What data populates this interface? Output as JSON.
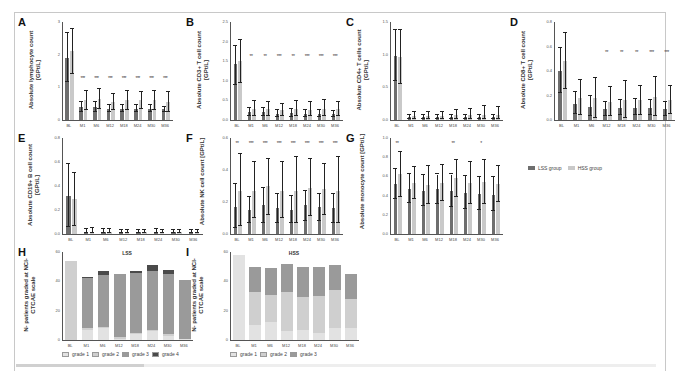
{
  "colors": {
    "lss": "#6e6e6e",
    "hss": "#c9c9c9",
    "grade1": "#e2e2e2",
    "grade2": "#cfcfcf",
    "grade3": "#9a9a9a",
    "grade4": "#4a4a4a"
  },
  "legend": {
    "lss": "LSS group",
    "hss": "HSS group"
  },
  "timepoints": [
    "BL",
    "M1",
    "M6",
    "M12",
    "M18",
    "M24",
    "M30",
    "M36"
  ],
  "chart_data": [
    {
      "id": "A",
      "type": "bar",
      "title": "",
      "ylabel": "Absolute lymphocyte count [GPt/L]",
      "ylim": [
        0,
        3
      ],
      "yticks": [
        "0",
        "1",
        "2",
        "3"
      ],
      "categories": [
        "BL",
        "M1",
        "M6",
        "M12",
        "M18",
        "M24",
        "M30",
        "M36"
      ],
      "series": [
        {
          "name": "LSS group",
          "values": [
            1.9,
            0.4,
            0.4,
            0.35,
            0.35,
            0.35,
            0.35,
            0.35
          ],
          "err_hi": [
            2.65,
            0.55,
            0.55,
            0.45,
            0.45,
            0.45,
            0.45,
            0.4
          ],
          "err_lo": [
            1.15,
            0.25,
            0.25,
            0.25,
            0.25,
            0.25,
            0.25,
            0.25
          ]
        },
        {
          "name": "HSS group",
          "values": [
            2.1,
            0.6,
            0.65,
            0.55,
            0.6,
            0.6,
            0.6,
            0.55
          ],
          "err_hi": [
            2.8,
            0.9,
            0.95,
            0.8,
            0.9,
            0.85,
            0.9,
            0.85
          ],
          "err_lo": [
            1.4,
            0.3,
            0.35,
            0.3,
            0.3,
            0.35,
            0.3,
            0.25
          ]
        }
      ],
      "significance": [
        "",
        "***",
        "***",
        "***",
        "***",
        "***",
        "***",
        "***"
      ]
    },
    {
      "id": "B",
      "type": "bar",
      "ylabel": "Absolute CD3+ T cell count [GPt/L]",
      "ylim": [
        0,
        2.5
      ],
      "yticks": [
        "0.0",
        "0.5",
        "1.0",
        "1.5",
        "2.0",
        "2.5"
      ],
      "categories": [
        "BL",
        "M1",
        "M6",
        "M12",
        "M18",
        "M24",
        "M30",
        "M36"
      ],
      "series": [
        {
          "name": "LSS group",
          "values": [
            1.42,
            0.2,
            0.2,
            0.15,
            0.17,
            0.15,
            0.15,
            0.15
          ],
          "err_hi": [
            1.9,
            0.3,
            0.3,
            0.25,
            0.27,
            0.25,
            0.25,
            0.22
          ],
          "err_lo": [
            0.9,
            0.1,
            0.1,
            0.08,
            0.08,
            0.08,
            0.08,
            0.08
          ]
        },
        {
          "name": "HSS group",
          "values": [
            1.5,
            0.28,
            0.27,
            0.25,
            0.27,
            0.26,
            0.28,
            0.27
          ],
          "err_hi": [
            2.05,
            0.48,
            0.46,
            0.4,
            0.48,
            0.46,
            0.52,
            0.46
          ],
          "err_lo": [
            0.95,
            0.1,
            0.1,
            0.1,
            0.1,
            0.1,
            0.1,
            0.1
          ]
        }
      ],
      "significance": [
        "",
        "**",
        "**",
        "***",
        "**",
        "***",
        "***",
        "***"
      ]
    },
    {
      "id": "C",
      "type": "bar",
      "ylabel": "Absolute CD4+ T cells count [GPt/L]",
      "ylim": [
        0,
        1.5
      ],
      "yticks": [
        "0.0",
        "0.5",
        "1.0",
        "1.5"
      ],
      "categories": [
        "BL",
        "M1",
        "M6",
        "M12",
        "M18",
        "M24",
        "M30",
        "M36"
      ],
      "series": [
        {
          "name": "LSS group",
          "values": [
            0.98,
            0.05,
            0.05,
            0.04,
            0.05,
            0.05,
            0.04,
            0.04
          ],
          "err_hi": [
            1.38,
            0.08,
            0.08,
            0.07,
            0.08,
            0.08,
            0.07,
            0.07
          ],
          "err_lo": [
            0.6,
            0.02,
            0.02,
            0.02,
            0.02,
            0.02,
            0.02,
            0.02
          ]
        },
        {
          "name": "HSS group",
          "values": [
            0.96,
            0.06,
            0.06,
            0.06,
            0.07,
            0.07,
            0.07,
            0.07
          ],
          "err_hi": [
            1.38,
            0.12,
            0.12,
            0.12,
            0.15,
            0.17,
            0.22,
            0.2
          ],
          "err_lo": [
            0.55,
            0.01,
            0.01,
            0.01,
            0.01,
            0.01,
            0.01,
            0.01
          ]
        }
      ],
      "significance": [
        "",
        "",
        "",
        "",
        "",
        "",
        "",
        ""
      ]
    },
    {
      "id": "D",
      "type": "bar",
      "ylabel": "Absolute CD8+ T cell count [GPt/L]",
      "ylim": [
        0,
        0.8
      ],
      "yticks": [
        "0.0",
        "0.2",
        "0.4",
        "0.6",
        "0.8"
      ],
      "categories": [
        "BL",
        "M1",
        "M6",
        "M12",
        "M18",
        "M24",
        "M30",
        "M36"
      ],
      "series": [
        {
          "name": "LSS group",
          "values": [
            0.4,
            0.13,
            0.11,
            0.09,
            0.1,
            0.1,
            0.1,
            0.09
          ],
          "err_hi": [
            0.59,
            0.23,
            0.2,
            0.15,
            0.16,
            0.17,
            0.16,
            0.15
          ],
          "err_lo": [
            0.22,
            0.05,
            0.03,
            0.03,
            0.04,
            0.04,
            0.04,
            0.03
          ]
        },
        {
          "name": "HSS group",
          "values": [
            0.48,
            0.18,
            0.18,
            0.15,
            0.16,
            0.16,
            0.19,
            0.16
          ],
          "err_hi": [
            0.71,
            0.33,
            0.34,
            0.27,
            0.32,
            0.28,
            0.35,
            0.28
          ],
          "err_lo": [
            0.25,
            0.04,
            0.02,
            0.03,
            0.02,
            0.04,
            0.03,
            0.05
          ]
        }
      ],
      "significance": [
        "",
        "",
        "",
        "**",
        "**",
        "**",
        "***",
        "***"
      ]
    },
    {
      "id": "E",
      "type": "bar",
      "ylabel": "Absolute CD19+ B cell count [GPt/L]",
      "ylim": [
        0,
        0.8
      ],
      "yticks": [
        "0.0",
        "0.2",
        "0.4",
        "0.6",
        "0.8"
      ],
      "categories": [
        "BL",
        "M1",
        "M6",
        "M12",
        "M18",
        "M24",
        "M30",
        "M36"
      ],
      "series": [
        {
          "name": "LSS group",
          "values": [
            0.32,
            0.02,
            0.02,
            0.02,
            0.02,
            0.02,
            0.02,
            0.02
          ],
          "err_hi": [
            0.58,
            0.04,
            0.04,
            0.03,
            0.03,
            0.04,
            0.03,
            0.03
          ],
          "err_lo": [
            0.06,
            0.005,
            0.005,
            0.005,
            0.005,
            0.005,
            0.005,
            0.005
          ]
        },
        {
          "name": "HSS group",
          "values": [
            0.29,
            0.02,
            0.02,
            0.02,
            0.015,
            0.02,
            0.015,
            0.015
          ],
          "err_hi": [
            0.51,
            0.05,
            0.04,
            0.03,
            0.03,
            0.03,
            0.03,
            0.03
          ],
          "err_lo": [
            0.07,
            0.005,
            0.005,
            0.005,
            0.005,
            0.005,
            0.005,
            0.005
          ]
        }
      ],
      "significance": [
        "",
        "",
        "",
        "",
        "",
        "",
        "",
        ""
      ]
    },
    {
      "id": "F",
      "type": "bar",
      "ylabel": "Absolute NK cell count [GPt/L]",
      "ylim": [
        0,
        0.6
      ],
      "yticks": [
        "0.0",
        "0.2",
        "0.4",
        "0.6"
      ],
      "categories": [
        "BL",
        "M1",
        "M6",
        "M12",
        "M18",
        "M24",
        "M30",
        "M36"
      ],
      "series": [
        {
          "name": "LSS group",
          "values": [
            0.17,
            0.15,
            0.18,
            0.16,
            0.15,
            0.18,
            0.17,
            0.16
          ],
          "err_hi": [
            0.31,
            0.23,
            0.29,
            0.25,
            0.24,
            0.27,
            0.25,
            0.25
          ],
          "err_lo": [
            0.04,
            0.07,
            0.07,
            0.07,
            0.07,
            0.08,
            0.08,
            0.07
          ]
        },
        {
          "name": "HSS group",
          "values": [
            0.27,
            0.27,
            0.3,
            0.27,
            0.27,
            0.29,
            0.28,
            0.27
          ],
          "err_hi": [
            0.5,
            0.45,
            0.47,
            0.45,
            0.48,
            0.47,
            0.44,
            0.48
          ],
          "err_lo": [
            0.05,
            0.1,
            0.12,
            0.1,
            0.07,
            0.11,
            0.12,
            0.07
          ]
        }
      ],
      "significance": [
        "**",
        "***",
        "***",
        "***",
        "***",
        "***",
        "***",
        "***"
      ]
    },
    {
      "id": "G",
      "type": "bar",
      "ylabel": "Absolute monocyte count [GPt/L]",
      "ylim": [
        0,
        1.0
      ],
      "yticks": [
        "0.0",
        "0.2",
        "0.4",
        "0.6",
        "0.8",
        "1.0"
      ],
      "categories": [
        "BL",
        "M1",
        "M6",
        "M12",
        "M18",
        "M24",
        "M30",
        "M36"
      ],
      "series": [
        {
          "name": "LSS group",
          "values": [
            0.52,
            0.47,
            0.45,
            0.47,
            0.45,
            0.43,
            0.42,
            0.41
          ],
          "err_hi": [
            0.68,
            0.62,
            0.61,
            0.62,
            0.62,
            0.6,
            0.59,
            0.59
          ],
          "err_lo": [
            0.36,
            0.32,
            0.29,
            0.31,
            0.28,
            0.26,
            0.25,
            0.24
          ]
        },
        {
          "name": "HSS group",
          "values": [
            0.62,
            0.53,
            0.51,
            0.53,
            0.58,
            0.53,
            0.54,
            0.52
          ],
          "err_hi": [
            0.85,
            0.7,
            0.71,
            0.72,
            0.77,
            0.75,
            0.77,
            0.71
          ],
          "err_lo": [
            0.39,
            0.36,
            0.31,
            0.34,
            0.39,
            0.31,
            0.31,
            0.33
          ]
        }
      ],
      "significance": [
        "**",
        "",
        "",
        "",
        "**",
        "",
        "*",
        ""
      ]
    },
    {
      "id": "H",
      "type": "bar",
      "stacked": true,
      "title": "LSS",
      "ylabel": "N- patients graded at NCI-CTCAE scale",
      "ylim": [
        0,
        60
      ],
      "yticks": [
        "0",
        "20",
        "40",
        "60"
      ],
      "categories": [
        "BL",
        "M1",
        "M6",
        "M12",
        "M18",
        "M24",
        "M30",
        "M36"
      ],
      "series": [
        {
          "name": "grade 1",
          "values": [
            0,
            7,
            8,
            1,
            4,
            6,
            3,
            1
          ]
        },
        {
          "name": "grade 2",
          "values": [
            54,
            1,
            1,
            1,
            1,
            1,
            1,
            0
          ]
        },
        {
          "name": "grade 3",
          "values": [
            0,
            34,
            35,
            43,
            41,
            40,
            41,
            40
          ]
        },
        {
          "name": "grade 4",
          "values": [
            0,
            1,
            3,
            0,
            1,
            4,
            3,
            0
          ]
        }
      ],
      "legend": [
        "grade 1",
        "grade 2",
        "grade 3",
        "grade 4"
      ]
    },
    {
      "id": "I",
      "type": "bar",
      "stacked": true,
      "title": "HSS",
      "ylabel": "N- patients graded at NCI-CTCAE scale",
      "ylim": [
        0,
        60
      ],
      "yticks": [
        "0",
        "20",
        "40",
        "60"
      ],
      "categories": [
        "BL",
        "M1",
        "M6",
        "M12",
        "M18",
        "M24",
        "M30",
        "M36"
      ],
      "series": [
        {
          "name": "grade 1",
          "values": [
            58,
            10,
            12,
            6,
            7,
            5,
            8,
            8
          ]
        },
        {
          "name": "grade 2",
          "values": [
            0,
            23,
            19,
            27,
            22,
            25,
            26,
            20
          ]
        },
        {
          "name": "grade 3",
          "values": [
            0,
            17,
            18,
            19,
            21,
            20,
            17,
            17
          ]
        }
      ],
      "legend": [
        "grade 1",
        "grade 2",
        "grade 3"
      ]
    }
  ]
}
